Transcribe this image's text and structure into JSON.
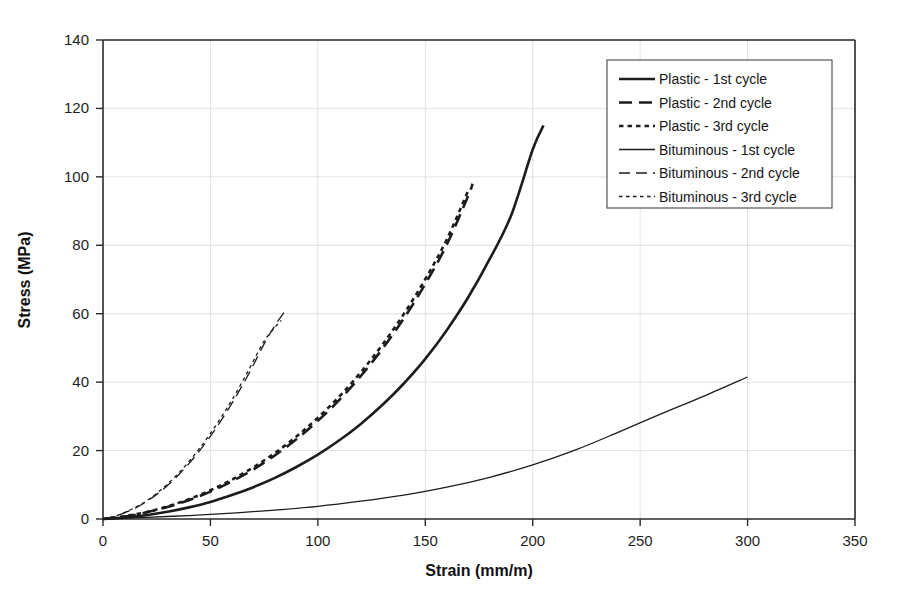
{
  "chart_data": {
    "type": "line",
    "title": "",
    "xlabel": "Strain (mm/m)",
    "ylabel": "Stress (MPa)",
    "xlim": [
      0,
      350
    ],
    "ylim": [
      0,
      140
    ],
    "xticks": [
      0,
      50,
      100,
      150,
      200,
      250,
      300,
      350
    ],
    "yticks": [
      0,
      20,
      40,
      60,
      80,
      100,
      120,
      140
    ],
    "grid": true,
    "legend_position": "top-right",
    "series": [
      {
        "name": "Plastic - 1st cycle",
        "style": "solid",
        "width": "thick",
        "color": "#1c1c1c",
        "x": [
          0,
          10,
          20,
          30,
          40,
          50,
          60,
          70,
          80,
          90,
          100,
          110,
          120,
          130,
          140,
          150,
          160,
          170,
          180,
          190,
          200,
          205
        ],
        "y": [
          0,
          0.4,
          1.1,
          2.1,
          3.4,
          5.0,
          7.0,
          9.3,
          12.0,
          15.2,
          18.8,
          23.0,
          27.8,
          33.3,
          39.6,
          46.8,
          55.2,
          64.8,
          76.0,
          88.8,
          108.0,
          115.0
        ]
      },
      {
        "name": "Plastic - 2nd cycle",
        "style": "dashed",
        "width": "thick",
        "color": "#1c1c1c",
        "x": [
          0,
          10,
          20,
          30,
          40,
          50,
          60,
          70,
          80,
          90,
          100,
          110,
          120,
          130,
          140,
          150,
          160,
          170,
          172
        ],
        "y": [
          0,
          0.7,
          1.9,
          3.5,
          5.5,
          8.0,
          11.0,
          14.5,
          18.6,
          23.3,
          28.7,
          34.8,
          41.8,
          49.7,
          58.6,
          68.7,
          80.2,
          94.5,
          98.0
        ]
      },
      {
        "name": "Plastic - 3rd cycle",
        "style": "dotted",
        "width": "thick",
        "color": "#1c1c1c",
        "x": [
          0,
          10,
          20,
          30,
          40,
          50,
          60,
          70,
          80,
          90,
          100,
          110,
          120,
          130,
          140,
          150,
          160,
          170
        ],
        "y": [
          0,
          0.8,
          2.0,
          3.7,
          5.8,
          8.4,
          11.5,
          15.1,
          19.3,
          24.1,
          29.6,
          35.8,
          42.9,
          50.9,
          59.9,
          70.1,
          81.7,
          96.0
        ]
      },
      {
        "name": "Bituminous - 1st cycle",
        "style": "solid",
        "width": "thin",
        "color": "#3a3a3a",
        "x": [
          0,
          20,
          40,
          60,
          80,
          100,
          120,
          140,
          160,
          180,
          200,
          220,
          240,
          260,
          280,
          300
        ],
        "y": [
          0,
          0.5,
          1.0,
          1.7,
          2.6,
          3.7,
          5.2,
          7.0,
          9.3,
          12.2,
          15.8,
          20.2,
          25.4,
          30.8,
          36.0,
          41.5
        ]
      },
      {
        "name": "Bituminous - 2nd cycle",
        "style": "dashed",
        "width": "thin",
        "color": "#3a3a3a",
        "x": [
          0,
          5,
          10,
          15,
          20,
          25,
          30,
          35,
          40,
          45,
          50,
          55,
          60,
          65,
          70,
          75,
          80,
          85
        ],
        "y": [
          0,
          0.7,
          1.8,
          3.2,
          5.0,
          7.2,
          9.8,
          12.8,
          16.2,
          20.0,
          24.2,
          28.8,
          33.8,
          39.2,
          45.0,
          51.2,
          56.5,
          61.0
        ]
      },
      {
        "name": "Bituminous - 3rd cycle",
        "style": "dotted",
        "width": "thin",
        "color": "#3a3a3a",
        "x": [
          0,
          5,
          10,
          15,
          20,
          25,
          30,
          35,
          40,
          45,
          50,
          55,
          60,
          65,
          70,
          75,
          80,
          83
        ],
        "y": [
          0,
          0.7,
          1.9,
          3.4,
          5.2,
          7.5,
          10.2,
          13.3,
          16.8,
          20.7,
          25.0,
          29.7,
          34.8,
          40.3,
          46.2,
          52.0,
          56.0,
          58.0
        ]
      }
    ]
  },
  "legend": {
    "entries": [
      "Plastic - 1st cycle",
      "Plastic - 2nd cycle",
      "Plastic - 3rd cycle",
      "Bituminous - 1st cycle",
      "Bituminous - 2nd cycle",
      "Bituminous - 3rd cycle"
    ]
  },
  "axes": {
    "x_title": "Strain (mm/m)",
    "y_title": "Stress (MPa)",
    "x_tick_labels": [
      "0",
      "50",
      "100",
      "150",
      "200",
      "250",
      "300",
      "350"
    ],
    "y_tick_labels": [
      "0",
      "20",
      "40",
      "60",
      "80",
      "100",
      "120",
      "140"
    ]
  }
}
